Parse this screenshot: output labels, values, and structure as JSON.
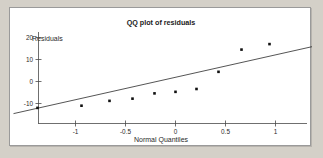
{
  "figure": {
    "background_color": "#d4d0c8",
    "panel_color": "#ffffff",
    "border_color": "#9a9a9a"
  },
  "chart_data": {
    "type": "scatter",
    "title": "QQ plot of residuals",
    "xlabel": "Normal Quantiles",
    "ylabel": "Residuals",
    "xlim": [
      -1.65,
      1.55
    ],
    "ylim": [
      -16,
      24
    ],
    "grid": false,
    "legend": null,
    "xticks": [
      -1,
      -0.5,
      0,
      0.5,
      1
    ],
    "xtick_labels": [
      "-1",
      "-0.5",
      "0",
      "0.5",
      "1"
    ],
    "yticks": [
      20,
      10,
      0,
      -10
    ],
    "ytick_labels": [
      "20",
      "10",
      "0",
      "-10"
    ],
    "point_color": "#111111",
    "line_color": "#2a2a2a",
    "series": [
      {
        "name": "residual quantiles",
        "marker": "square",
        "x": [
          -1.38,
          -0.94,
          -0.66,
          -0.43,
          -0.21,
          0.0,
          0.21,
          0.43,
          0.66,
          0.94,
          1.38
        ],
        "y": [
          -12.0,
          -11.0,
          -8.8,
          -7.8,
          -5.4,
          -4.7,
          -3.4,
          4.4,
          14.5,
          17.0,
          21.8
        ]
      }
    ],
    "reference_line": {
      "name": "fit line",
      "x": [
        -1.62,
        1.5
      ],
      "y": [
        -14.6,
        17.2
      ]
    }
  },
  "annotations": {
    "title_text": "QQ plot of residuals",
    "y_axis_caption": "Residuals",
    "x_axis_caption": "Normal Quantiles"
  }
}
